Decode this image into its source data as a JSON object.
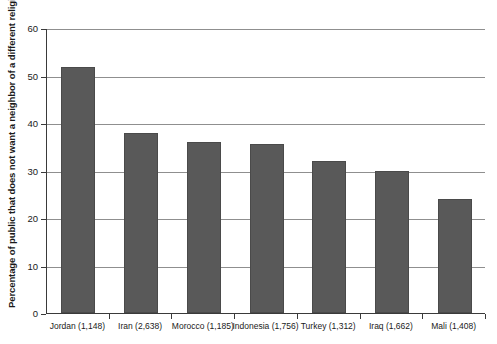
{
  "chart_data": {
    "type": "bar",
    "title": "",
    "subtitle": "",
    "xlabel": "",
    "ylabel": "Percentage of public that does not want a neighbor of a different religion",
    "ylim": [
      0,
      60
    ],
    "ytick_labels": [
      "0",
      "10",
      "20",
      "30",
      "40",
      "50",
      "60"
    ],
    "ytick_values": [
      0,
      10,
      20,
      30,
      40,
      50,
      60
    ],
    "grid": true,
    "legend": "none",
    "categories": [
      "Jordan (1,148)",
      "Iran (2,638)",
      "Morocco (1,185)",
      "Indonesia (1,756)",
      "Turkey (1,312)",
      "Iraq (1,662)",
      "Mali (1,408)"
    ],
    "values": [
      51.7,
      37.8,
      36.0,
      35.5,
      32.0,
      30.0,
      24.0
    ],
    "bar_color": "#595959",
    "bar_border_color": "#4a4a4a",
    "gridline_color": "#8f8f8f",
    "axis_color": "#3a3a3a",
    "background_color": "#ffffff"
  }
}
